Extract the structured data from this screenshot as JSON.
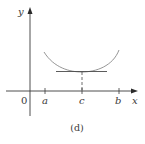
{
  "figure": {
    "caption": "(d)",
    "axes": {
      "x_label": "x",
      "y_label": "y",
      "origin_label": "0"
    },
    "ticks": [
      {
        "label": "a",
        "x": 45
      },
      {
        "label": "c",
        "x": 82
      },
      {
        "label": "b",
        "x": 119
      }
    ],
    "curve": {
      "description": "Upward-opening curve with a minimum at x = c and a horizontal tangent line at the minimum point",
      "color": "#8a8a8a"
    },
    "tangent_line": {
      "description": "Horizontal tangent at (c, f(c))",
      "color": "#4a4a4a"
    },
    "colors": {
      "axis": "#3a3a3a",
      "text": "#3a3a3a",
      "background": "#ffffff"
    }
  }
}
